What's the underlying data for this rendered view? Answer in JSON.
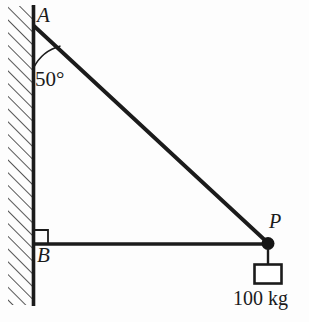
{
  "figure": {
    "type": "statics-free-body-diagram",
    "background_color": "#fdfdfd",
    "stroke_color": "#1b1b1b",
    "labels": {
      "point_a": "A",
      "point_b": "B",
      "point_p": "P",
      "angle": "50°",
      "mass": "100 kg"
    },
    "geometry": {
      "wall_x": 33,
      "wall_top_y": 6,
      "wall_bottom_y": 305,
      "hatch_left_x": 8,
      "point_a": [
        33,
        26
      ],
      "point_b": [
        33,
        244
      ],
      "point_p": [
        268,
        244
      ],
      "angle_degrees": 50,
      "angle_arc_radius": 42,
      "right_angle_marker": [
        33,
        244
      ],
      "load_box": [
        254,
        264,
        27,
        20
      ],
      "hanger_line_bottom_y": 264
    },
    "icons": {
      "wall": "hatched-wall",
      "pin": "filled-circle-joint",
      "weight": "rectangle-block",
      "right_angle": "square-marker"
    }
  }
}
